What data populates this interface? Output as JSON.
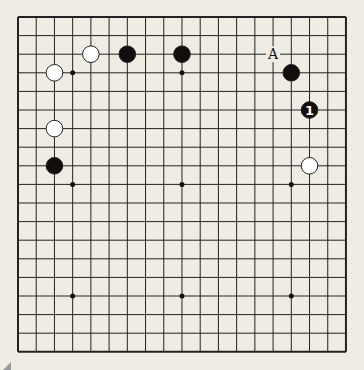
{
  "board": {
    "size": 19,
    "origin": [
      18,
      17
    ],
    "spacing": [
      18.22,
      18.6
    ],
    "background": "#efece3",
    "line_color": "#222222",
    "hoshi": [
      [
        3,
        3
      ],
      [
        9,
        3
      ],
      [
        15,
        3
      ],
      [
        3,
        9
      ],
      [
        9,
        9
      ],
      [
        15,
        9
      ],
      [
        3,
        15
      ],
      [
        9,
        15
      ],
      [
        15,
        15
      ]
    ]
  },
  "stones": [
    {
      "color": "white",
      "col": 4,
      "row": 2
    },
    {
      "color": "black",
      "col": 6,
      "row": 2
    },
    {
      "color": "black",
      "col": 9,
      "row": 2
    },
    {
      "color": "white",
      "col": 2,
      "row": 3
    },
    {
      "color": "white",
      "col": 2,
      "row": 6
    },
    {
      "color": "black",
      "col": 2,
      "row": 8
    },
    {
      "color": "black",
      "col": 15,
      "row": 3
    },
    {
      "color": "black",
      "col": 16,
      "row": 5,
      "label": "1"
    },
    {
      "color": "white",
      "col": 16,
      "row": 8
    }
  ],
  "markers": [
    {
      "text": "A",
      "col": 14,
      "row": 2
    }
  ]
}
